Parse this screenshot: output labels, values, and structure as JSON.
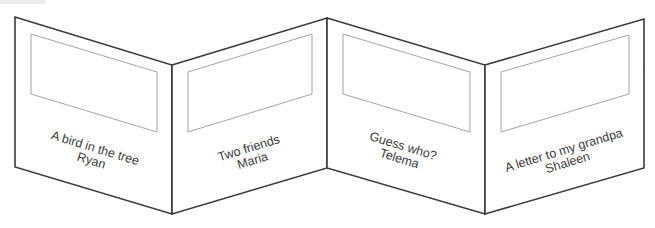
{
  "diagram": {
    "type": "accordion-folded-book",
    "panel_count": 4,
    "colors": {
      "outline": "#3a3a3a",
      "frame": "#9a9a9a",
      "text": "#3a3a3a",
      "background": "#ffffff"
    },
    "panels": [
      {
        "title": "A bird in the tree",
        "author": "Ryan"
      },
      {
        "title": "Two friends",
        "author": "Maria"
      },
      {
        "title": "Guess who?",
        "author": "Telema"
      },
      {
        "title": "A letter to my grandpa",
        "author": "Shaleen"
      }
    ]
  }
}
